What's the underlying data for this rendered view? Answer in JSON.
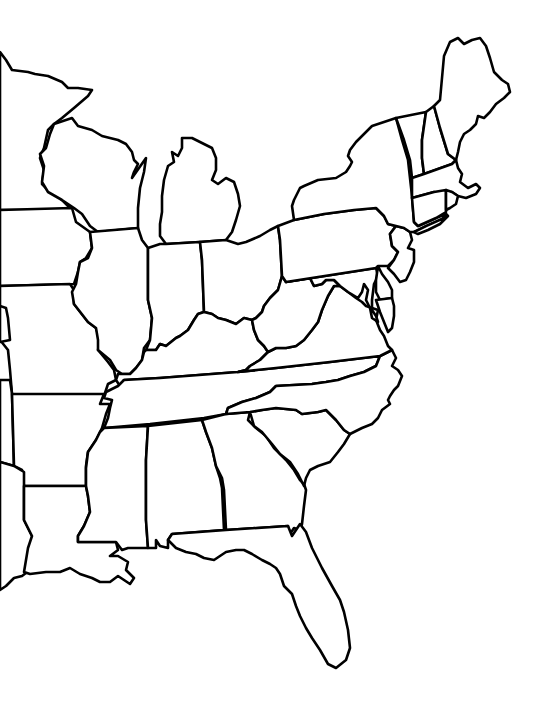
{
  "map": {
    "title": "",
    "type": "blank outline map",
    "region": "Eastern United States",
    "labels_visible": false,
    "background_color": "#ffffff",
    "outline_color": "#000000",
    "states": [
      {
        "id": "minnesota",
        "name": "Minnesota",
        "partial": true
      },
      {
        "id": "iowa",
        "name": "Iowa",
        "partial": true
      },
      {
        "id": "missouri",
        "name": "Missouri",
        "partial": true
      },
      {
        "id": "arkansas",
        "name": "Arkansas",
        "partial": true
      },
      {
        "id": "louisiana",
        "name": "Louisiana",
        "partial": true
      },
      {
        "id": "texas",
        "name": "Texas",
        "partial": true
      },
      {
        "id": "oklahoma",
        "name": "Oklahoma",
        "partial": true
      },
      {
        "id": "kansas",
        "name": "Kansas",
        "partial": true
      },
      {
        "id": "wisconsin",
        "name": "Wisconsin",
        "partial": false
      },
      {
        "id": "illinois",
        "name": "Illinois",
        "partial": false
      },
      {
        "id": "michigan",
        "name": "Michigan",
        "partial": false
      },
      {
        "id": "indiana",
        "name": "Indiana",
        "partial": false
      },
      {
        "id": "ohio",
        "name": "Ohio",
        "partial": false
      },
      {
        "id": "kentucky",
        "name": "Kentucky",
        "partial": false
      },
      {
        "id": "tennessee",
        "name": "Tennessee",
        "partial": false
      },
      {
        "id": "mississippi",
        "name": "Mississippi",
        "partial": false
      },
      {
        "id": "alabama",
        "name": "Alabama",
        "partial": false
      },
      {
        "id": "georgia",
        "name": "Georgia",
        "partial": false
      },
      {
        "id": "florida",
        "name": "Florida",
        "partial": false
      },
      {
        "id": "south-carolina",
        "name": "South Carolina",
        "partial": false
      },
      {
        "id": "north-carolina",
        "name": "North Carolina",
        "partial": false
      },
      {
        "id": "virginia",
        "name": "Virginia",
        "partial": false
      },
      {
        "id": "west-virginia",
        "name": "West Virginia",
        "partial": false
      },
      {
        "id": "maryland",
        "name": "Maryland",
        "partial": false
      },
      {
        "id": "delaware",
        "name": "Delaware",
        "partial": false
      },
      {
        "id": "pennsylvania",
        "name": "Pennsylvania",
        "partial": false
      },
      {
        "id": "new-jersey",
        "name": "New Jersey",
        "partial": false
      },
      {
        "id": "new-york",
        "name": "New York",
        "partial": false
      },
      {
        "id": "vermont",
        "name": "Vermont",
        "partial": false
      },
      {
        "id": "new-hampshire",
        "name": "New Hampshire",
        "partial": false
      },
      {
        "id": "maine",
        "name": "Maine",
        "partial": false
      },
      {
        "id": "massachusetts",
        "name": "Massachusetts",
        "partial": false
      },
      {
        "id": "connecticut",
        "name": "Connecticut",
        "partial": false
      },
      {
        "id": "rhode-island",
        "name": "Rhode Island",
        "partial": false
      }
    ]
  }
}
